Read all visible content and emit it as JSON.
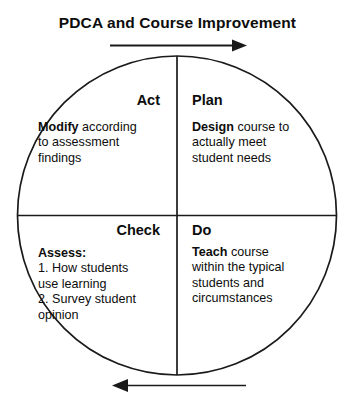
{
  "diagram": {
    "title": "PDCA and Course Improvement",
    "type": "pdca-cycle-circle",
    "stroke_color": "#1a1a1a",
    "text_color": "#0d0d0d",
    "background_color": "#ffffff",
    "arrows": {
      "top": {
        "name": "top-arrow",
        "direction": "right",
        "label": ""
      },
      "bottom": {
        "name": "bottom-arrow",
        "direction": "left",
        "label": ""
      }
    },
    "quadrants": {
      "act": {
        "title": "Act",
        "position": "upper-left",
        "lead": "Modify",
        "rest": " according",
        "lines": [
          "to assessment",
          "findings"
        ]
      },
      "plan": {
        "title": "Plan",
        "position": "upper-right",
        "lead": "Design",
        "rest": " course to",
        "lines": [
          "actually meet",
          "student needs"
        ]
      },
      "check": {
        "title": "Check",
        "position": "lower-left",
        "lead": "Assess:",
        "rest": "",
        "lines": [
          "1. How students",
          "use learning",
          "2. Survey student",
          "opinion"
        ]
      },
      "do": {
        "title": "Do",
        "position": "lower-right",
        "lead": "Teach",
        "rest": " course",
        "lines": [
          "within the typical",
          "students and",
          "circumstances"
        ]
      }
    }
  }
}
